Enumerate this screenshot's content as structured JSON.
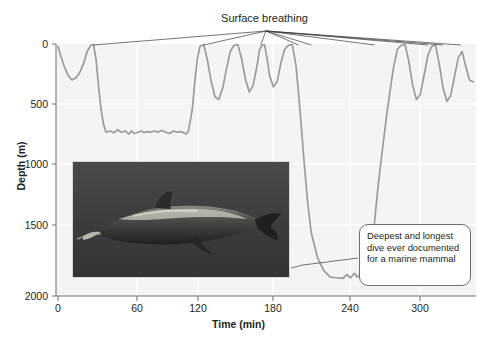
{
  "figure": {
    "title": "",
    "annotations": {
      "surface_breathing": "Surface breathing",
      "callout": "Deepest and longest dive ever documented for a marine mammal"
    },
    "photo_alt": "underwater-photo-of-beaked-whale"
  },
  "colors": {
    "trace": "#9b9b9b",
    "leader": "#3a3a3a",
    "text": "#231f20",
    "plot_bg": "#f7f7f7",
    "grid": "#ffffff",
    "callout_border": "#6d6e71"
  },
  "chart_data": {
    "type": "line",
    "title": "",
    "xlabel": "Time (min)",
    "ylabel": "Depth (m)",
    "xlim": [
      0,
      330
    ],
    "ylim": [
      2000,
      0
    ],
    "y_inverted": true,
    "grid": true,
    "legend": "none",
    "xticks": [
      0,
      60,
      120,
      180,
      240,
      300
    ],
    "yticks": [
      0,
      500,
      1000,
      1500,
      2000
    ],
    "series": [
      {
        "name": "Dive profile",
        "x": [
          0,
          2,
          5,
          8,
          11,
          14,
          17,
          20,
          23,
          26,
          28,
          30,
          32,
          34,
          36,
          38,
          41,
          44,
          47,
          50,
          53,
          56,
          58,
          60,
          63,
          66,
          68,
          70,
          73,
          76,
          79,
          82,
          85,
          88,
          91,
          94,
          97,
          99,
          101,
          103,
          106,
          108,
          110,
          112,
          115,
          118,
          121,
          124,
          127,
          130,
          133,
          136,
          139,
          142,
          145,
          148,
          151,
          154,
          157,
          159,
          161,
          163,
          165,
          167,
          170,
          173,
          176,
          179,
          182,
          185,
          188,
          191,
          194,
          197,
          200,
          205,
          210,
          215,
          220,
          225,
          228,
          231,
          234,
          236,
          238,
          240,
          242,
          244,
          246,
          248,
          250,
          253,
          256,
          259,
          262,
          265,
          268,
          271,
          274,
          277,
          280,
          283,
          286,
          289,
          292,
          295,
          298,
          301,
          304,
          307,
          310,
          313,
          316,
          319,
          322,
          325,
          328
        ],
        "y": [
          20,
          90,
          180,
          250,
          285,
          270,
          230,
          160,
          60,
          10,
          5,
          120,
          330,
          520,
          640,
          700,
          690,
          705,
          680,
          700,
          690,
          715,
          690,
          710,
          700,
          690,
          705,
          695,
          700,
          690,
          700,
          685,
          700,
          710,
          690,
          700,
          695,
          705,
          715,
          690,
          520,
          300,
          120,
          20,
          5,
          130,
          300,
          420,
          440,
          350,
          200,
          60,
          10,
          5,
          120,
          280,
          380,
          330,
          180,
          50,
          10,
          5,
          110,
          250,
          340,
          300,
          150,
          40,
          10,
          5,
          180,
          520,
          900,
          1250,
          1500,
          1700,
          1800,
          1850,
          1855,
          1860,
          1830,
          1855,
          1820,
          1850,
          1835,
          1860,
          1840,
          1855,
          1830,
          1700,
          1400,
          1100,
          850,
          600,
          380,
          180,
          40,
          10,
          5,
          140,
          330,
          440,
          400,
          250,
          90,
          20,
          5,
          160,
          350,
          455,
          410,
          260,
          110,
          60,
          180,
          290,
          300
        ],
        "notes": "Depth-vs-time dive record; surface (0 m) returns are breathing events. Deep first dive plateaus near 700 m; the extreme dive reaches about 1860 m."
      }
    ],
    "annotated_points": {
      "surface_breathing_times": [
        28,
        115,
        160,
        190,
        200,
        250,
        292,
        304,
        318
      ],
      "deepest_depth_m": 1860,
      "deepest_dive_start_min": 190,
      "deepest_dive_end_min": 252
    }
  }
}
